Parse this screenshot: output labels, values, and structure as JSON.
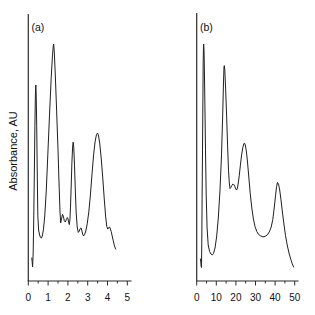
{
  "figure": {
    "background": "#ffffff",
    "trace_color": "#1f1f1f",
    "axis_color": "#2b2b2b",
    "ylabel": "Absorbance, AU"
  },
  "chart_data": [
    {
      "type": "line",
      "panel_label": "(a)",
      "xlabel": "",
      "ylabel": "Absorbance, AU",
      "xlim": [
        0,
        5
      ],
      "ylim": [
        0,
        1.05
      ],
      "grid": false,
      "legend": "none",
      "x_ticks": [
        0,
        1,
        2,
        3,
        4,
        5
      ],
      "x_tick_labels": [
        "0",
        "1",
        "2",
        "3",
        "4",
        "5"
      ],
      "x_minor_ticks": [
        0.5,
        1.5,
        2.5,
        3.5,
        4.5
      ],
      "peaks_x": [
        0.38,
        1.28,
        2.27,
        3.5
      ],
      "series": [
        {
          "name": "absorbance-trace-a",
          "points": [
            [
              0.177,
              0.097
            ],
            [
              0.197,
              0.08
            ],
            [
              0.217,
              0.059
            ],
            [
              0.247,
              0.122
            ],
            [
              0.278,
              0.278
            ],
            [
              0.308,
              0.477
            ],
            [
              0.333,
              0.658
            ],
            [
              0.359,
              0.785
            ],
            [
              0.379,
              0.827
            ],
            [
              0.399,
              0.785
            ],
            [
              0.424,
              0.658
            ],
            [
              0.449,
              0.477
            ],
            [
              0.48,
              0.278
            ],
            [
              0.52,
              0.215
            ],
            [
              0.571,
              0.194
            ],
            [
              0.616,
              0.184
            ],
            [
              0.657,
              0.181
            ],
            [
              0.707,
              0.19
            ],
            [
              0.768,
              0.219
            ],
            [
              0.833,
              0.278
            ],
            [
              0.909,
              0.384
            ],
            [
              0.985,
              0.532
            ],
            [
              1.071,
              0.7
            ],
            [
              1.157,
              0.857
            ],
            [
              1.222,
              0.954
            ],
            [
              1.263,
              0.994
            ],
            [
              1.283,
              1.0
            ],
            [
              1.313,
              0.966
            ],
            [
              1.364,
              0.869
            ],
            [
              1.429,
              0.721
            ],
            [
              1.5,
              0.553
            ],
            [
              1.561,
              0.392
            ],
            [
              1.601,
              0.291
            ],
            [
              1.636,
              0.245
            ],
            [
              1.677,
              0.262
            ],
            [
              1.727,
              0.281
            ],
            [
              1.768,
              0.274
            ],
            [
              1.818,
              0.255
            ],
            [
              1.869,
              0.249
            ],
            [
              1.919,
              0.259
            ],
            [
              1.97,
              0.268
            ],
            [
              2.005,
              0.262
            ],
            [
              2.04,
              0.247
            ],
            [
              2.071,
              0.238
            ],
            [
              2.101,
              0.257
            ],
            [
              2.131,
              0.312
            ],
            [
              2.167,
              0.401
            ],
            [
              2.202,
              0.498
            ],
            [
              2.237,
              0.565
            ],
            [
              2.268,
              0.586
            ],
            [
              2.298,
              0.561
            ],
            [
              2.333,
              0.489
            ],
            [
              2.374,
              0.384
            ],
            [
              2.419,
              0.287
            ],
            [
              2.47,
              0.228
            ],
            [
              2.525,
              0.205
            ],
            [
              2.576,
              0.211
            ],
            [
              2.626,
              0.222
            ],
            [
              2.662,
              0.224
            ],
            [
              2.702,
              0.213
            ],
            [
              2.747,
              0.198
            ],
            [
              2.793,
              0.19
            ],
            [
              2.843,
              0.196
            ],
            [
              2.904,
              0.211
            ],
            [
              2.975,
              0.241
            ],
            [
              3.056,
              0.291
            ],
            [
              3.136,
              0.363
            ],
            [
              3.217,
              0.451
            ],
            [
              3.298,
              0.532
            ],
            [
              3.379,
              0.591
            ],
            [
              3.444,
              0.618
            ],
            [
              3.495,
              0.624
            ],
            [
              3.551,
              0.612
            ],
            [
              3.611,
              0.578
            ],
            [
              3.682,
              0.519
            ],
            [
              3.758,
              0.439
            ],
            [
              3.833,
              0.35
            ],
            [
              3.904,
              0.274
            ],
            [
              3.965,
              0.23
            ],
            [
              4.015,
              0.219
            ],
            [
              4.066,
              0.226
            ],
            [
              4.106,
              0.228
            ],
            [
              4.146,
              0.219
            ],
            [
              4.187,
              0.209
            ],
            [
              4.237,
              0.19
            ],
            [
              4.293,
              0.169
            ],
            [
              4.354,
              0.148
            ],
            [
              4.409,
              0.135
            ]
          ]
        }
      ],
      "layout": {
        "x0_px": 28.3,
        "px_per_unit": 19.8,
        "baseline_px": 281,
        "y_scale_px": 237,
        "yaxis_top_px": 14,
        "xaxis_end_px": 131.5,
        "label_x_px": 31.5,
        "label_y_px": 31,
        "major_tick_len": 4.5,
        "minor_tick_len": 2.5,
        "tick_label_y_px": 301
      }
    },
    {
      "type": "line",
      "panel_label": "(b)",
      "xlabel": "",
      "ylabel": "",
      "xlim": [
        0,
        50
      ],
      "ylim": [
        0,
        1.05
      ],
      "grid": false,
      "legend": "none",
      "x_ticks": [
        0,
        10,
        20,
        30,
        40,
        50
      ],
      "x_tick_labels": [
        "0",
        "10",
        "20",
        "30",
        "40",
        "50"
      ],
      "x_minor_ticks": [
        5,
        15,
        25,
        35,
        45
      ],
      "peaks_x": [
        3.5,
        14.1,
        24.4,
        41.2
      ],
      "series": [
        {
          "name": "absorbance-trace-b",
          "points": [
            [
              1.888,
              0.093
            ],
            [
              2.092,
              0.08
            ],
            [
              2.296,
              0.061
            ],
            [
              2.449,
              0.057
            ],
            [
              2.602,
              0.173
            ],
            [
              2.755,
              0.342
            ],
            [
              2.959,
              0.553
            ],
            [
              3.163,
              0.764
            ],
            [
              3.316,
              0.924
            ],
            [
              3.469,
              0.994
            ],
            [
              3.571,
              1.0
            ],
            [
              3.724,
              0.975
            ],
            [
              3.929,
              0.89
            ],
            [
              4.184,
              0.743
            ],
            [
              4.49,
              0.553
            ],
            [
              4.847,
              0.363
            ],
            [
              5.306,
              0.224
            ],
            [
              5.867,
              0.152
            ],
            [
              6.582,
              0.124
            ],
            [
              7.296,
              0.114
            ],
            [
              7.959,
              0.11
            ],
            [
              8.571,
              0.116
            ],
            [
              9.337,
              0.139
            ],
            [
              10.153,
              0.186
            ],
            [
              11.02,
              0.266
            ],
            [
              11.888,
              0.384
            ],
            [
              12.653,
              0.532
            ],
            [
              13.265,
              0.7
            ],
            [
              13.673,
              0.84
            ],
            [
              13.929,
              0.903
            ],
            [
              14.082,
              0.909
            ],
            [
              14.337,
              0.89
            ],
            [
              14.745,
              0.814
            ],
            [
              15.255,
              0.7
            ],
            [
              15.765,
              0.57
            ],
            [
              16.224,
              0.468
            ],
            [
              16.633,
              0.414
            ],
            [
              16.99,
              0.39
            ],
            [
              17.398,
              0.395
            ],
            [
              17.908,
              0.403
            ],
            [
              18.418,
              0.409
            ],
            [
              18.929,
              0.407
            ],
            [
              19.439,
              0.399
            ],
            [
              19.949,
              0.388
            ],
            [
              20.357,
              0.384
            ],
            [
              20.765,
              0.392
            ],
            [
              21.224,
              0.414
            ],
            [
              21.735,
              0.447
            ],
            [
              22.296,
              0.489
            ],
            [
              22.908,
              0.532
            ],
            [
              23.52,
              0.563
            ],
            [
              24.031,
              0.579
            ],
            [
              24.388,
              0.582
            ],
            [
              24.796,
              0.574
            ],
            [
              25.306,
              0.549
            ],
            [
              25.918,
              0.502
            ],
            [
              26.582,
              0.439
            ],
            [
              27.296,
              0.371
            ],
            [
              28.112,
              0.308
            ],
            [
              28.929,
              0.262
            ],
            [
              29.745,
              0.23
            ],
            [
              30.663,
              0.209
            ],
            [
              31.633,
              0.196
            ],
            [
              32.704,
              0.19
            ],
            [
              33.827,
              0.186
            ],
            [
              34.949,
              0.188
            ],
            [
              36.02,
              0.194
            ],
            [
              37.041,
              0.207
            ],
            [
              38.01,
              0.228
            ],
            [
              38.827,
              0.259
            ],
            [
              39.541,
              0.308
            ],
            [
              40.204,
              0.359
            ],
            [
              40.765,
              0.399
            ],
            [
              41.224,
              0.416
            ],
            [
              41.735,
              0.409
            ],
            [
              42.347,
              0.384
            ],
            [
              43.01,
              0.342
            ],
            [
              43.724,
              0.291
            ],
            [
              44.49,
              0.241
            ],
            [
              45.306,
              0.192
            ],
            [
              46.173,
              0.152
            ],
            [
              47.092,
              0.118
            ],
            [
              48.01,
              0.091
            ],
            [
              48.776,
              0.072
            ],
            [
              49.439,
              0.059
            ]
          ]
        }
      ],
      "layout": {
        "x0_px": 196.7,
        "px_per_unit": 1.96,
        "baseline_px": 281,
        "y_scale_px": 237,
        "yaxis_top_px": 13,
        "xaxis_end_px": 298.6,
        "label_x_px": 200,
        "label_y_px": 31,
        "major_tick_len": 4.5,
        "minor_tick_len": 2.5,
        "tick_label_y_px": 301
      }
    }
  ],
  "ylabel_position": {
    "x_px": 17,
    "y_px": 151
  }
}
